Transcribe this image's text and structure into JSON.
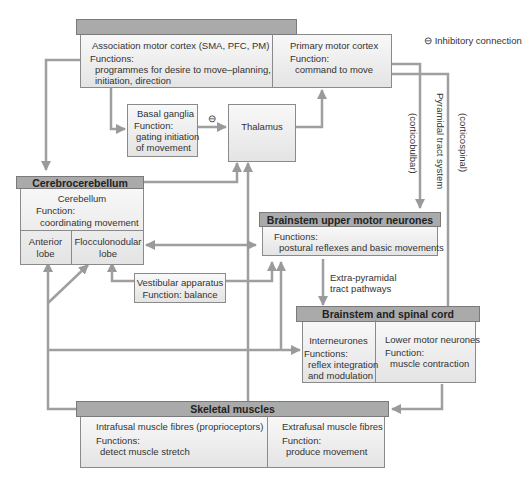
{
  "legend": {
    "symbol": "⊖",
    "label": "Inhibitory connection"
  },
  "motor_cortex": {
    "title": "Motor cortex",
    "association": {
      "name": "Association motor cortex (SMA, PFC, PM)",
      "function_label": "Functions:",
      "function_line1": "programmes for desire to move–planning,",
      "function_line2": "initiation, direction"
    },
    "primary": {
      "name": "Primary motor cortex",
      "function_label": "Function:",
      "function_line1": "command to move"
    }
  },
  "basal_ganglia": {
    "name": "Basal ganglia",
    "function_label": "Function:",
    "function_line1": "gating initiation",
    "function_line2": "of movement"
  },
  "inhibitory_marker": "⊖",
  "thalamus": {
    "name": "Thalamus"
  },
  "pathway_labels": {
    "pyramidal": "Pyramidal tract system",
    "corticobulbar": "(corticobulbar)",
    "corticospinal": "(corticospinal)",
    "extrapyramidal_line1": "Extra-pyramidal",
    "extrapyramidal_line2": "tract pathways"
  },
  "cerebrocerebellum": {
    "title": "Cerebrocerebellum",
    "cerebellum": {
      "name": "Cerebellum",
      "function_label": "Function:",
      "function_line1": "coordinating movement"
    },
    "anterior_lobe": {
      "line1": "Anterior",
      "line2": "lobe"
    },
    "flocculonodular_lobe": {
      "line1": "Flocculonodular",
      "line2": "lobe"
    }
  },
  "brainstem_upper": {
    "title": "Brainstem upper motor neurones",
    "function_label": "Functions:",
    "function_line1": "postural reflexes and basic movements"
  },
  "vestibular": {
    "line1": "Vestibular apparatus",
    "line2": "Function: balance"
  },
  "brainstem_spinal": {
    "title": "Brainstem and spinal cord",
    "interneurones": {
      "name": "Interneurones",
      "function_label": "Functions:",
      "function_line1": "reflex integration",
      "function_line2": "and modulation"
    },
    "lower_motor": {
      "name": "Lower motor neurones",
      "function_label": "Function:",
      "function_line1": "muscle contraction"
    }
  },
  "skeletal_muscles": {
    "title": "Skeletal muscles",
    "intrafusal": {
      "name": "Intrafusal muscle fibres (proprioceptors)",
      "function_label": "Functions:",
      "function_line1": "detect muscle stretch"
    },
    "extrafusal": {
      "name": "Extrafusal muscle fibres",
      "function_label": "Function:",
      "function_line1": "produce movement"
    }
  },
  "colors": {
    "header": "#aaaaaa",
    "line": "#9a9a9a",
    "box_border": "#8a8a8a"
  }
}
